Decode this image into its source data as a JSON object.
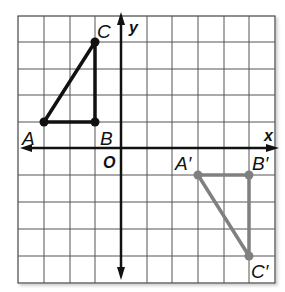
{
  "diagram": {
    "type": "coordinate-plane-translation",
    "axes": {
      "x_label": "x",
      "y_label": "y",
      "origin_label": "O"
    },
    "grid": {
      "columns": 10,
      "rows": 10
    },
    "original_triangle": {
      "color": "#111111",
      "points": [
        {
          "label": "A",
          "x": -3,
          "y": 1
        },
        {
          "label": "B",
          "x": -1,
          "y": 1
        },
        {
          "label": "C",
          "x": -1,
          "y": 4
        }
      ]
    },
    "image_triangle": {
      "color": "#808080",
      "points": [
        {
          "label": "A′",
          "x": 3,
          "y": -1
        },
        {
          "label": "B′",
          "x": 5,
          "y": -1
        },
        {
          "label": "C′",
          "x": 5,
          "y": -4
        }
      ]
    }
  }
}
